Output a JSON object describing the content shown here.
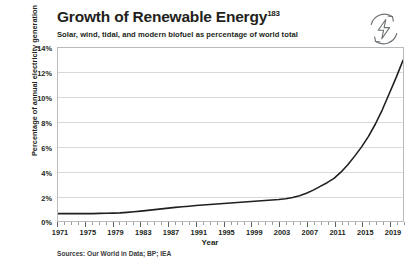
{
  "header": {
    "title": "Growth of Renewable Energy",
    "title_superscript": "183",
    "subtitle": "Solar, wind, tidal, and modern biofuel as percentage of world total",
    "icon": "renewable-energy-icon"
  },
  "footer": {
    "sources": "Sources: Our World in Data; BP; IEA"
  },
  "chart_data": {
    "type": "line",
    "title": "Growth of Renewable Energy",
    "subtitle": "Solar, wind, tidal, and modern biofuel as percentage of world total",
    "xlabel": "Year",
    "ylabel": "Percentage of annual electricity generation",
    "xlim": [
      1971,
      2021
    ],
    "ylim": [
      0,
      14
    ],
    "ytick_labels": [
      "0%",
      "2%",
      "4%",
      "6%",
      "8%",
      "10%",
      "12%",
      "14%"
    ],
    "ytick_values": [
      0,
      2,
      4,
      6,
      8,
      10,
      12,
      14
    ],
    "xtick_labels": [
      "1971",
      "1975",
      "1979",
      "1983",
      "1987",
      "1991",
      "1995",
      "1999",
      "2003",
      "2007",
      "2011",
      "2015",
      "2019"
    ],
    "xtick_values": [
      1971,
      1975,
      1979,
      1983,
      1987,
      1991,
      1995,
      1999,
      2003,
      2007,
      2011,
      2015,
      2019
    ],
    "xtick_minor_step": 1,
    "grid": "horizontal",
    "legend": "none",
    "line_color": "#231f20",
    "line_width": 1.6,
    "series": [
      {
        "name": "Renewables share of electricity generation",
        "x": [
          1971,
          1972,
          1973,
          1974,
          1975,
          1976,
          1977,
          1978,
          1979,
          1980,
          1981,
          1982,
          1983,
          1984,
          1985,
          1986,
          1987,
          1988,
          1989,
          1990,
          1991,
          1992,
          1993,
          1994,
          1995,
          1996,
          1997,
          1998,
          1999,
          2000,
          2001,
          2002,
          2003,
          2004,
          2005,
          2006,
          2007,
          2008,
          2009,
          2010,
          2011,
          2012,
          2013,
          2014,
          2015,
          2016,
          2017,
          2018,
          2019,
          2020,
          2021
        ],
        "values": [
          0.6,
          0.6,
          0.6,
          0.6,
          0.6,
          0.6,
          0.62,
          0.63,
          0.64,
          0.66,
          0.7,
          0.75,
          0.8,
          0.86,
          0.92,
          0.98,
          1.04,
          1.1,
          1.15,
          1.2,
          1.26,
          1.3,
          1.34,
          1.38,
          1.42,
          1.46,
          1.5,
          1.54,
          1.58,
          1.62,
          1.66,
          1.7,
          1.74,
          1.8,
          1.9,
          2.05,
          2.25,
          2.5,
          2.8,
          3.1,
          3.45,
          3.95,
          4.55,
          5.25,
          6.0,
          6.85,
          7.85,
          9.0,
          10.3,
          11.6,
          13.0
        ]
      }
    ]
  }
}
